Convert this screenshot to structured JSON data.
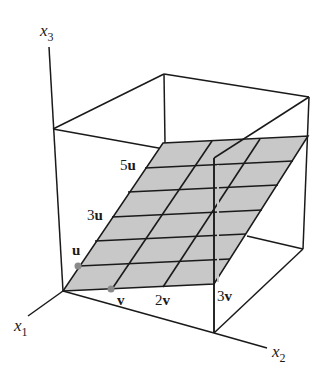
{
  "figure": {
    "axes": {
      "x1": {
        "label": "x",
        "sub": "1"
      },
      "x2": {
        "label": "x",
        "sub": "2"
      },
      "x3": {
        "label": "x",
        "sub": "3"
      }
    },
    "u_labels": [
      {
        "coef": "",
        "vec": "u"
      },
      {
        "coef": "3",
        "vec": "u"
      },
      {
        "coef": "5",
        "vec": "u"
      }
    ],
    "v_labels": [
      {
        "coef": "",
        "vec": "v"
      },
      {
        "coef": "2",
        "vec": "v"
      },
      {
        "coef": "3",
        "vec": "v"
      }
    ],
    "colors": {
      "plane_fill": "#c8c8c8",
      "line": "#1a1a1a",
      "point": "#8a8a8a",
      "background": "#ffffff"
    },
    "grid": {
      "u_steps": 6,
      "v_steps": 3
    }
  }
}
